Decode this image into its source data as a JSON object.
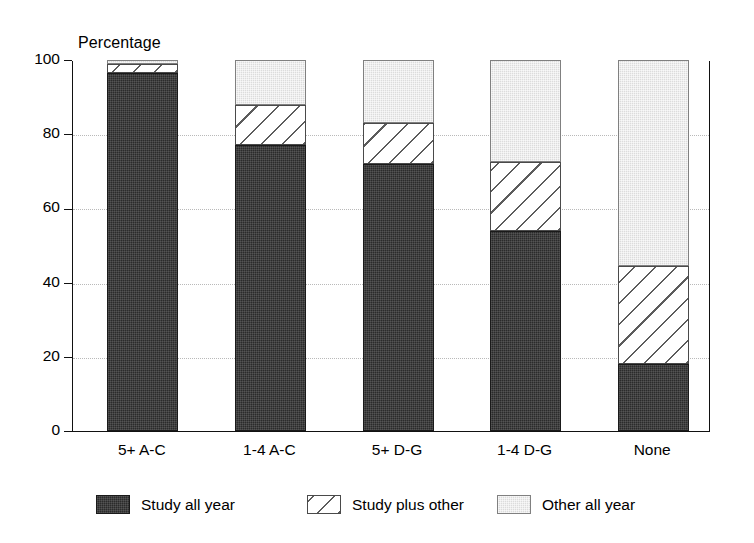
{
  "chart_data": {
    "type": "bar",
    "subtype": "stacked-bar-100",
    "title": "",
    "ylabel": "Percentage",
    "xlabel": "",
    "ylim": [
      0,
      100
    ],
    "yticks": [
      0,
      20,
      40,
      60,
      80,
      100
    ],
    "ytick_labels": [
      "0",
      "20",
      "40",
      "60",
      "80",
      "100"
    ],
    "grid": "horizontal-dotted",
    "legend_position": "bottom",
    "categories": [
      "5+ A-C",
      "1-4 A-C",
      "5+ D-G",
      "1-4 D-G",
      "None"
    ],
    "series": [
      {
        "name": "Study all year",
        "fill": "dark",
        "color": "#2b2b2b",
        "values": [
          96.5,
          77,
          72,
          54,
          18
        ]
      },
      {
        "name": "Study plus other",
        "fill": "diagonal-hatch",
        "color": "#ffffff",
        "values": [
          2.5,
          11,
          11,
          18.5,
          26.5
        ]
      },
      {
        "name": "Other all year",
        "fill": "light",
        "color": "#dcdcdc",
        "values": [
          1,
          12,
          17,
          27.5,
          55.5
        ]
      }
    ],
    "cumulative_tops": [
      [
        96.5,
        99,
        100
      ],
      [
        77,
        88,
        100
      ],
      [
        72,
        83,
        100
      ],
      [
        54,
        72.5,
        100
      ],
      [
        18,
        44.5,
        100
      ]
    ]
  },
  "legend": {
    "items": [
      {
        "label": "Study all year",
        "fill": "dark"
      },
      {
        "label": "Study plus other",
        "fill": "diagonal-hatch"
      },
      {
        "label": "Other all year",
        "fill": "light"
      }
    ]
  }
}
